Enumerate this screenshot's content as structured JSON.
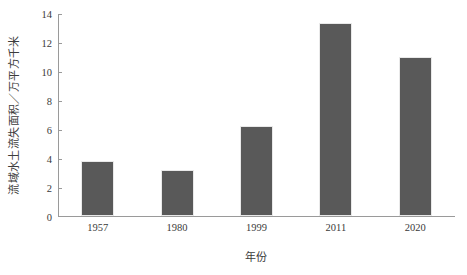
{
  "chart_data": {
    "type": "bar",
    "title": "",
    "categories": [
      "1957",
      "1980",
      "1999",
      "2011",
      "2020"
    ],
    "values": [
      3.8,
      3.2,
      6.2,
      13.3,
      11.0
    ],
    "xlabel": "年份",
    "ylabel": "流域水土流失面积／万平方千米",
    "ylim": [
      0,
      14
    ],
    "yticks": [
      0,
      2,
      4,
      6,
      8,
      10,
      12,
      14
    ],
    "ytick_labels": [
      "0",
      "2",
      "4",
      "6",
      "8",
      "10",
      "12",
      "14"
    ],
    "grid": false,
    "legend": null,
    "bar_color": "#595959",
    "axis_color": "#9a9a9a",
    "background_color": "#ffffff"
  }
}
